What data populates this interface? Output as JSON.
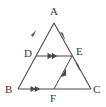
{
  "figure": {
    "type": "geometry-diagram",
    "shape_name": "triangle-with-midsegments",
    "stroke_color": "#4a4a4a",
    "label_color": "#3a3a3a",
    "background_color": "#ffffff",
    "width": 106,
    "height": 107
  },
  "labels": {
    "a": "A",
    "b": "B",
    "c": "C",
    "d": "D",
    "e": "E",
    "f": "F"
  },
  "points": {
    "A": {
      "x": 54,
      "y": 23
    },
    "B": {
      "x": 18,
      "y": 89
    },
    "C": {
      "x": 91,
      "y": 89
    },
    "D": {
      "x": 36,
      "y": 56
    },
    "E": {
      "x": 72,
      "y": 56
    },
    "F": {
      "x": 54,
      "y": 89
    }
  },
  "label_positions": {
    "A": {
      "x": 50,
      "y": 6
    },
    "B": {
      "x": 5,
      "y": 84
    },
    "C": {
      "x": 93,
      "y": 84
    },
    "D": {
      "x": 24,
      "y": 48
    },
    "E": {
      "x": 76,
      "y": 46
    },
    "F": {
      "x": 50,
      "y": 93
    }
  },
  "segments": [
    {
      "name": "side-AB",
      "from": "A",
      "to": "B",
      "marker": "single-arrow-toward-A"
    },
    {
      "name": "side-AC",
      "from": "A",
      "to": "C",
      "marker": "single-arrow-toward-C"
    },
    {
      "name": "side-BC",
      "from": "B",
      "to": "C",
      "marker": "double-arrow-toward-C"
    },
    {
      "name": "segment-DE",
      "from": "D",
      "to": "E",
      "marker": "double-arrow-toward-E"
    },
    {
      "name": "segment-FE",
      "from": "F",
      "to": "E",
      "marker": "single-arrow-toward-E"
    }
  ],
  "annotations": {
    "parallel_pairs": [
      {
        "pair": [
          "segment-DE",
          "side-BC"
        ],
        "marks": 2
      },
      {
        "pair": [
          "segment-FE",
          "side-AB"
        ],
        "marks": 1
      }
    ]
  }
}
